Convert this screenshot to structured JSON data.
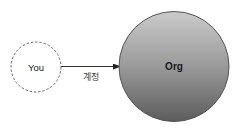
{
  "diagram": {
    "nodes": [
      {
        "id": "you",
        "label": "You",
        "style": "dashed-outline"
      },
      {
        "id": "org",
        "label": "Org",
        "style": "filled-gradient"
      }
    ],
    "edges": [
      {
        "from": "you",
        "to": "org",
        "label": "계정"
      }
    ]
  },
  "colors": {
    "stroke": "#555555",
    "org_fill_top": "#c9c9c9",
    "org_fill_bottom": "#5f5f5f",
    "text": "#222222"
  }
}
